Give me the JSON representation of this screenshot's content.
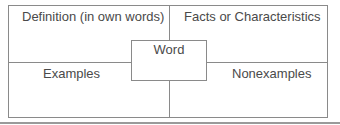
{
  "diagram": {
    "type": "frayer-model",
    "center": {
      "label": "Word"
    },
    "quadrants": {
      "top_left": "Definition (in own words)",
      "top_right": "Facts or Characteristics",
      "bottom_left": "Examples",
      "bottom_right": "Nonexamples"
    },
    "colors": {
      "line": "#8a8a8a",
      "text": "#4a4a4a",
      "background": "#ffffff"
    }
  }
}
